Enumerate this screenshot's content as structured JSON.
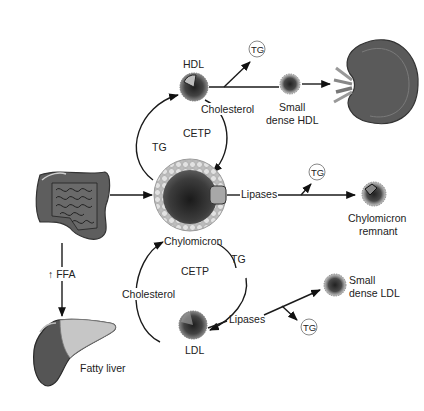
{
  "diagram": {
    "nodes": {
      "hdl": {
        "label": "HDL"
      },
      "small_dense_hdl": {
        "line1": "Small",
        "line2": "dense HDL"
      },
      "kidney": {
        "label": ""
      },
      "intestine": {
        "label": ""
      },
      "chylomicron": {
        "label": "Chylomicron"
      },
      "chylomicron_remnant": {
        "line1": "Chylomicron",
        "line2": "remnant"
      },
      "ldl": {
        "label": "LDL"
      },
      "small_dense_ldl": {
        "line1": "Small",
        "line2": "dense LDL"
      },
      "fatty_liver": {
        "label": "Fatty liver"
      }
    },
    "edges": {
      "top_cycle": {
        "center": "CETP",
        "left": "TG",
        "right": "Cholesterol"
      },
      "bottom_cycle": {
        "center": "CETP",
        "left": "Cholesterol",
        "right": "TG"
      },
      "chylo_lipases": "Lipases",
      "ldl_lipases": "Lipases",
      "ffa": "↑ FFA"
    },
    "tg_bubbles": [
      "TG",
      "TG",
      "TG"
    ],
    "colors": {
      "organ_dark": "#4a4a4a",
      "organ_mid": "#6e6e6e",
      "liver_fat": "#c8c8c8",
      "particle_core": "#3a3a3a",
      "shell": "#d6d6d6"
    }
  }
}
